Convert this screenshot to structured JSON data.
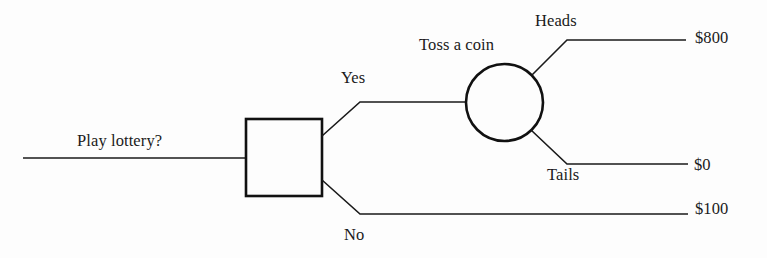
{
  "diagram": {
    "type": "decision-tree",
    "background_color": "#fdfdfd",
    "stroke_color": "#1a1a1a",
    "node_stroke_color": "#111111",
    "root": {
      "label": "Play lottery?",
      "node_shape": "square",
      "node_kind": "decision"
    },
    "chance_node": {
      "label": "Toss a coin",
      "node_shape": "circle",
      "node_kind": "chance"
    },
    "branches": [
      {
        "label": "Yes",
        "from": "decision",
        "to": "chance"
      },
      {
        "label": "No",
        "from": "decision",
        "to": "payoff-no"
      },
      {
        "label": "Heads",
        "from": "chance",
        "to": "payoff-heads"
      },
      {
        "label": "Tails",
        "from": "chance",
        "to": "payoff-tails"
      }
    ],
    "payoffs": [
      {
        "id": "payoff-heads",
        "value": "$800"
      },
      {
        "id": "payoff-tails",
        "value": "$0"
      },
      {
        "id": "payoff-no",
        "value": "$100"
      }
    ]
  }
}
